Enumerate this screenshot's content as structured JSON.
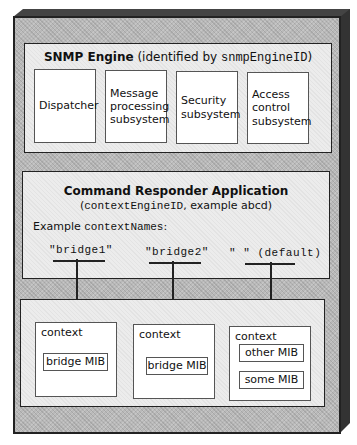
{
  "engine": {
    "title_bold": "SNMP Engine",
    "title_rest": " (identified by ",
    "title_mono": "snmpEngineID",
    "title_close": ")",
    "subsystems": [
      {
        "label": "Dispatcher"
      },
      {
        "label": "Message processing subsystem"
      },
      {
        "label": "Security subsystem"
      },
      {
        "label": "Access control subsystem"
      }
    ]
  },
  "application": {
    "title": "Command Responder Application",
    "subtitle_open": "(",
    "subtitle_mono": "contextEngineID",
    "subtitle_rest": ", example abcd)",
    "names_label": "Example ",
    "names_label_mono": "contextNames",
    "names_label_colon": ":",
    "context_names": [
      {
        "label": "\"bridge1\""
      },
      {
        "label": "\"bridge2\""
      },
      {
        "label": "\" \" (default)"
      }
    ]
  },
  "contexts": [
    {
      "label": "context",
      "mibs": [
        "bridge MIB"
      ]
    },
    {
      "label": "context",
      "mibs": [
        "bridge MIB"
      ]
    },
    {
      "label": "context",
      "mibs": [
        "other MIB",
        "some MIB"
      ]
    }
  ],
  "colors": {
    "frame": "#b9b9b9",
    "panel": "#ececec",
    "box": "#ffffff",
    "line": "#222222"
  }
}
